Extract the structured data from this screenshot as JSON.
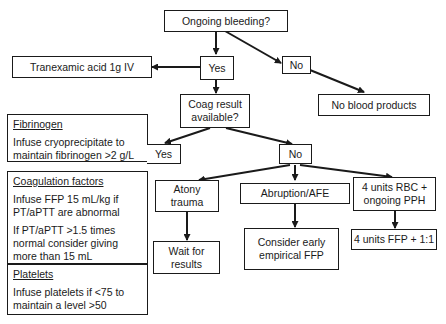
{
  "diagram": {
    "nodes": {
      "ongoing_bleeding": "Ongoing bleeding?",
      "yes_top": "Yes",
      "no_top": "No",
      "tranexamic": "Tranexamic acid 1g IV",
      "no_blood_products": "No blood products",
      "coag_result": [
        "Coag result",
        "available?"
      ],
      "yes_coag": "Yes",
      "no_coag": "No",
      "atony": [
        "Atony",
        "trauma"
      ],
      "abruption": "Abruption/AFE",
      "rbc": [
        "4 units RBC +",
        "ongoing PPH"
      ],
      "wait": [
        "Wait for",
        "results"
      ],
      "consider": [
        "Consider early",
        "empirical FFP"
      ],
      "ffp": "4 units FFP + 1:1"
    },
    "side_panel": {
      "fibrinogen": {
        "heading": "Fibrinogen",
        "text": "Infuse cryoprecipitate to maintain fibrinogen >2 g/L"
      },
      "coagulation": {
        "heading": "Coagulation factors",
        "text1": "Infuse FFP 15 mL/kg if PT/aPTT are abnormal",
        "text2": "If PT/aPTT >1.5 times normal consider giving more than 15 mL"
      },
      "platelets": {
        "heading": "Platelets",
        "text": "Infuse platelets if <75 to maintain a level >50"
      }
    },
    "edges": [
      [
        "Ongoing bleeding?",
        "Yes"
      ],
      [
        "Ongoing bleeding?",
        "No"
      ],
      [
        "Yes",
        "Tranexamic acid 1g IV"
      ],
      [
        "Yes",
        "Coag result available?"
      ],
      [
        "No",
        "No blood products"
      ],
      [
        "Coag result available?",
        "Yes"
      ],
      [
        "Coag result available?",
        "No"
      ],
      [
        "No",
        "Atony trauma"
      ],
      [
        "No",
        "Abruption/AFE"
      ],
      [
        "No",
        "4 units RBC + ongoing PPH"
      ],
      [
        "Atony trauma",
        "Wait for results"
      ],
      [
        "Abruption/AFE",
        "Consider early empirical FFP"
      ],
      [
        "4 units RBC + ongoing PPH",
        "4 units FFP + 1:1"
      ]
    ]
  }
}
